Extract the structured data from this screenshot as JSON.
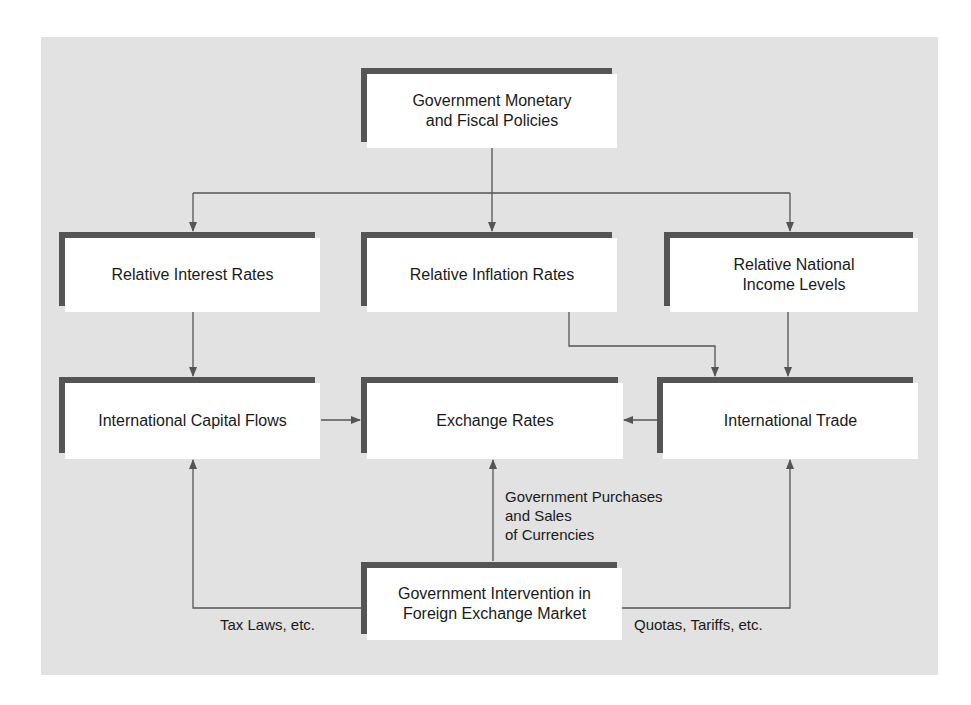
{
  "colors": {
    "background": "#ffffff",
    "panel": "#e2e2e2",
    "box_fill": "#ffffff",
    "box_frame": "#555555",
    "connector": "#555555",
    "text": "#1a1a1a"
  },
  "nodes": {
    "policies": {
      "label": "Government Monetary\nand Fiscal Policies"
    },
    "interest_rates": {
      "label": "Relative Interest Rates"
    },
    "inflation_rates": {
      "label": "Relative Inflation Rates"
    },
    "income_levels": {
      "label": "Relative National\nIncome Levels"
    },
    "capital_flows": {
      "label": "International Capital Flows"
    },
    "exchange_rates": {
      "label": "Exchange Rates"
    },
    "trade": {
      "label": "International Trade"
    },
    "intervention": {
      "label": "Government Intervention in\nForeign Exchange Market"
    }
  },
  "edge_labels": {
    "purchases_sales": "Government Purchases\nand Sales\nof Currencies",
    "tax_laws": "Tax Laws, etc.",
    "quotas_tariffs": "Quotas, Tariffs, etc."
  },
  "edges": [
    {
      "from": "policies",
      "to": "interest_rates"
    },
    {
      "from": "policies",
      "to": "inflation_rates"
    },
    {
      "from": "policies",
      "to": "income_levels"
    },
    {
      "from": "interest_rates",
      "to": "capital_flows"
    },
    {
      "from": "inflation_rates",
      "to": "trade"
    },
    {
      "from": "income_levels",
      "to": "trade"
    },
    {
      "from": "capital_flows",
      "to": "exchange_rates"
    },
    {
      "from": "trade",
      "to": "exchange_rates"
    },
    {
      "from": "intervention",
      "to": "exchange_rates",
      "label": "Government Purchases and Sales of Currencies"
    },
    {
      "from": "intervention",
      "to": "capital_flows",
      "label": "Tax Laws, etc."
    },
    {
      "from": "intervention",
      "to": "trade",
      "label": "Quotas, Tariffs, etc."
    }
  ]
}
